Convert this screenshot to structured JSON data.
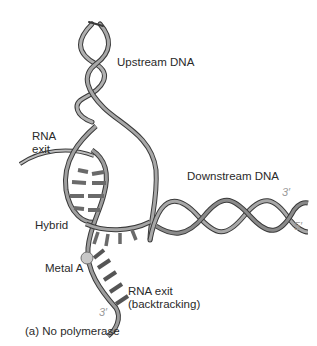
{
  "labels": {
    "upstream_dna": "Upstream DNA",
    "rna_exit_line1": "RNA",
    "rna_exit_line2": "exit",
    "downstream_dna": "Downstream DNA",
    "hybrid": "Hybrid",
    "metal_a": "Metal A",
    "rna_exit_backtracking_line1": "RNA exit",
    "rna_exit_backtracking_line2": "(backtracking)"
  },
  "strand_ends": {
    "downstream_top": "3′",
    "downstream_bottom": "5′",
    "rna_backtrack_end": "3′"
  },
  "caption": "(a) No polymerase",
  "colors": {
    "ribbon_fill": "#9a9a9a",
    "ribbon_edge": "#3a3a3a",
    "metal": "#c8c8c8",
    "end_label": "#9a9a9a"
  }
}
